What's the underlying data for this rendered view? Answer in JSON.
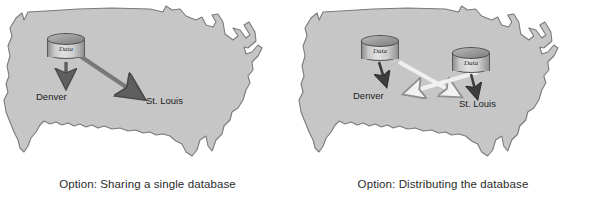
{
  "figure": {
    "colors": {
      "map_fill": "#c6c6c6",
      "map_outline": "#7a7a7a",
      "dark_arrow": "#6e6e6e",
      "light_arrow": "#efefef",
      "light_arrow_outline": "#9a9a9a",
      "caption_text": "#2b2b2b",
      "background": "#ffffff"
    }
  },
  "panels": [
    {
      "id": "sharing-single-database",
      "caption": "Option: Sharing a single database",
      "databases": [
        {
          "id": "db-central",
          "label": "Data"
        }
      ],
      "cities": [
        {
          "id": "denver",
          "label": "Denver"
        },
        {
          "id": "st-louis",
          "label": "St. Louis"
        }
      ],
      "arrows": [
        {
          "id": "arrow-db-to-denver",
          "style": "dark",
          "from": "db-central",
          "to": "denver"
        },
        {
          "id": "arrow-db-to-st-louis",
          "style": "dark",
          "from": "db-central",
          "to": "st-louis"
        }
      ]
    },
    {
      "id": "distributing-the-database",
      "caption": "Option: Distributing the database",
      "databases": [
        {
          "id": "db-west",
          "label": "Data"
        },
        {
          "id": "db-east",
          "label": "Data"
        }
      ],
      "cities": [
        {
          "id": "denver",
          "label": "Denver"
        },
        {
          "id": "st-louis",
          "label": "St. Louis"
        }
      ],
      "arrows": [
        {
          "id": "arrow-west-db-to-denver",
          "style": "dark",
          "from": "db-west",
          "to": "denver"
        },
        {
          "id": "arrow-east-db-to-st-louis",
          "style": "dark",
          "from": "db-east",
          "to": "st-louis"
        },
        {
          "id": "arrow-west-db-to-st-louis",
          "style": "light",
          "from": "db-west",
          "to": "st-louis"
        },
        {
          "id": "arrow-east-db-to-denver",
          "style": "light",
          "from": "db-east",
          "to": "denver"
        }
      ]
    }
  ]
}
